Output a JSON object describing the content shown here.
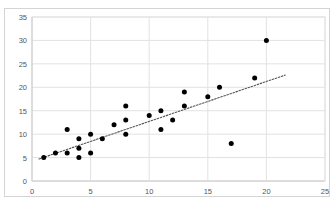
{
  "clipped_top_text": "",
  "chart_data": {
    "type": "scatter",
    "title": "",
    "xlabel": "",
    "ylabel": "",
    "xlim": [
      0,
      25
    ],
    "ylim": [
      0,
      35
    ],
    "xticks": [
      0,
      5,
      10,
      15,
      20,
      25
    ],
    "yticks": [
      0,
      5,
      10,
      15,
      20,
      25,
      30,
      35
    ],
    "grid": true,
    "grid_axis": "both",
    "legend": "none",
    "marker": {
      "shape": "circle",
      "color": "#000000",
      "size_px": 5
    },
    "series": [
      {
        "name": "data",
        "points": [
          [
            1,
            5
          ],
          [
            2,
            6
          ],
          [
            3,
            6
          ],
          [
            3,
            11
          ],
          [
            4,
            5
          ],
          [
            4,
            7
          ],
          [
            4,
            9
          ],
          [
            5,
            6
          ],
          [
            5,
            10
          ],
          [
            6,
            9
          ],
          [
            7,
            12
          ],
          [
            8,
            10
          ],
          [
            8,
            13
          ],
          [
            8,
            16
          ],
          [
            10,
            14
          ],
          [
            11,
            11
          ],
          [
            11,
            15
          ],
          [
            12,
            13
          ],
          [
            13,
            16
          ],
          [
            13,
            19
          ],
          [
            15,
            18
          ],
          [
            16,
            20
          ],
          [
            17,
            8
          ],
          [
            19,
            22
          ],
          [
            20,
            30
          ]
        ]
      }
    ],
    "trendline": {
      "type": "linear",
      "style": "dotted",
      "color": "#555555",
      "x_start": 0.6,
      "y_start": 4.7,
      "x_end": 21.6,
      "y_end": 22.6
    }
  },
  "colors": {
    "marker": "#000000",
    "gridline": "#e2e2e2",
    "axis": "#b0b0b0",
    "frame": "#d4d4d4",
    "tick_text": "#555555",
    "background": "#ffffff"
  }
}
